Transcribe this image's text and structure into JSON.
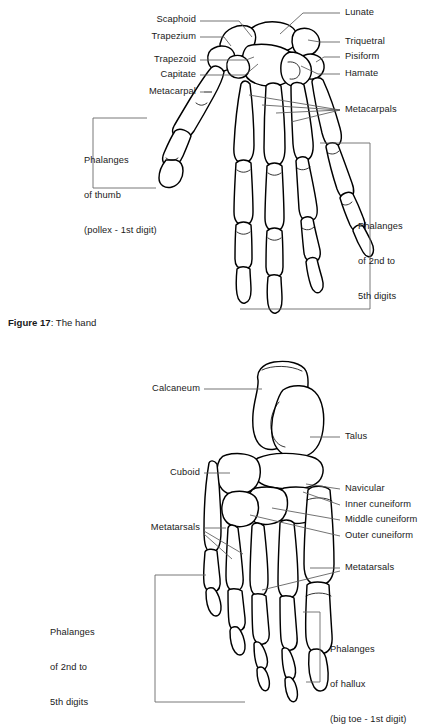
{
  "figures": [
    {
      "id": "hand",
      "caption_prefix": "Figure 17",
      "caption_rest": ": The hand",
      "labels_left": [
        {
          "name": "scaphoid",
          "text": "Scaphoid"
        },
        {
          "name": "trapezium",
          "text": "Trapezium"
        },
        {
          "name": "trapezoid",
          "text": "Trapezoid"
        },
        {
          "name": "capitate",
          "text": "Capitate"
        },
        {
          "name": "metacarpal",
          "text": "Metacarpal"
        }
      ],
      "labels_right": [
        {
          "name": "lunate",
          "text": "Lunate"
        },
        {
          "name": "triquetral",
          "text": "Triquetral"
        },
        {
          "name": "pisiform",
          "text": "Pisiform"
        },
        {
          "name": "hamate",
          "text": "Hamate"
        },
        {
          "name": "metacarpals",
          "text": "Metacarpals"
        }
      ],
      "bracket_left": {
        "name": "phalanges-of-thumb",
        "lines": [
          "Phalanges",
          "of thumb",
          "(pollex - 1st digit)"
        ]
      },
      "bracket_right": {
        "name": "phalanges-2nd-to-5th-digits",
        "lines": [
          "Phalanges",
          "of 2nd to",
          "5th digits"
        ]
      }
    },
    {
      "id": "foot",
      "labels_left": [
        {
          "name": "calcaneum",
          "text": "Calcaneum"
        },
        {
          "name": "cuboid",
          "text": "Cuboid"
        },
        {
          "name": "metatarsals",
          "text": "Metatarsals"
        }
      ],
      "labels_right": [
        {
          "name": "talus",
          "text": "Talus"
        },
        {
          "name": "navicular",
          "text": "Navicular"
        },
        {
          "name": "inner-cuneiform",
          "text": "Inner cuneiform"
        },
        {
          "name": "middle-cuneiform",
          "text": "Middle cuneiform"
        },
        {
          "name": "outer-cuneiform",
          "text": "Outer cuneiform"
        },
        {
          "name": "metatarsals-right",
          "text": "Metatarsals"
        }
      ],
      "bracket_left": {
        "name": "phalanges-2nd-to-5th-digits-foot",
        "lines": [
          "Phalanges",
          "of 2nd to",
          "5th digits"
        ]
      },
      "bracket_right": {
        "name": "phalanges-of-hallux",
        "lines": [
          "Phalanges",
          "of hallux",
          "(big toe - 1st digit)"
        ]
      }
    }
  ],
  "colors": {
    "text": "#1a1a1a",
    "bone_outline": "#000000",
    "bone_fill": "#ffffff",
    "leader": "#5a5a5a",
    "bracket": "#6a6a6a",
    "background": "#ffffff"
  }
}
